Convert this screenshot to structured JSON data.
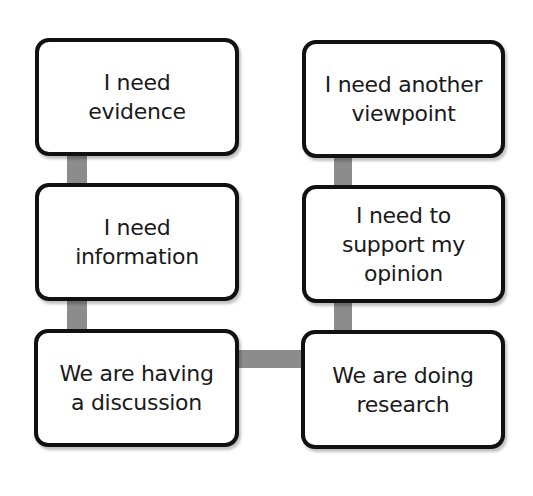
{
  "diagram": {
    "left_column": [
      {
        "id": "evidence",
        "lines": [
          "I need",
          "evidence"
        ]
      },
      {
        "id": "information",
        "lines": [
          "I need",
          "information"
        ]
      },
      {
        "id": "discussion",
        "lines": [
          "We are having",
          "a discussion"
        ]
      }
    ],
    "right_column": [
      {
        "id": "viewpoint",
        "lines": [
          "I need another",
          "viewpoint"
        ]
      },
      {
        "id": "support-opinion",
        "lines": [
          "I need to",
          "support my",
          "opinion"
        ]
      },
      {
        "id": "research",
        "lines": [
          "We are doing",
          "research"
        ]
      }
    ],
    "connections": [
      {
        "from": "discussion",
        "to": "information"
      },
      {
        "from": "information",
        "to": "evidence"
      },
      {
        "from": "discussion",
        "to": "research"
      },
      {
        "from": "research",
        "to": "support-opinion"
      },
      {
        "from": "support-opinion",
        "to": "viewpoint"
      }
    ],
    "colors": {
      "box_border": "#111111",
      "box_fill": "#ffffff",
      "connector": "#8c8c8c",
      "text": "#1a1a1a"
    }
  }
}
